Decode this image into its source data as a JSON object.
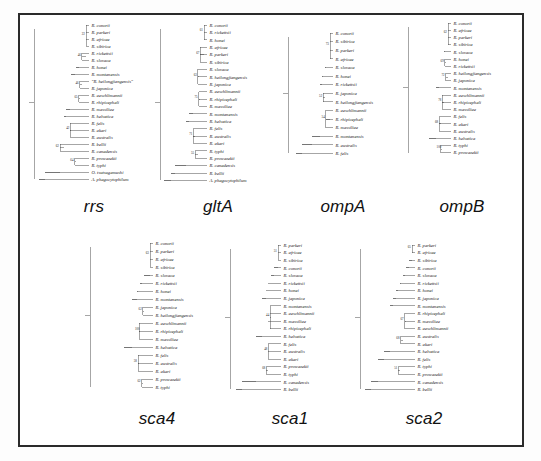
{
  "figure": {
    "caption_present": false,
    "panel_count": 7,
    "frame_color": "#2b2b2b",
    "branch_color": "#3a3a3a"
  },
  "panels": [
    {
      "id": "rrs",
      "gene_label": "rrs",
      "row": 1,
      "taxa": [
        "R. conorii",
        "R. parkeri",
        "R. africae",
        "R. sibirica",
        "R. rickettsii",
        "R. slovaca",
        "R. honei",
        "R. montanensis",
        "\"R. heilongjiangensis\"",
        "R. japonica",
        "R. aeschlimannii",
        "R. rhipicephali",
        "R. massiliae",
        "R. helvetica",
        "R. felis",
        "R. akari",
        "R. australis",
        "R. bellii",
        "R. canadensis",
        "R. prowazekii",
        "R. typhi",
        "O. tsutsugamushi",
        "A. phagocytophilum"
      ],
      "bootstraps": [
        "22",
        "46",
        "46",
        "65",
        "42",
        "62",
        "64",
        "79",
        "60",
        "61",
        "82",
        "44",
        "49",
        "52",
        "48",
        "40",
        "48",
        "65",
        "100",
        "100"
      ],
      "outgroups": [
        "O. tsutsugamushi",
        "A. phagocytophilum"
      ]
    },
    {
      "id": "gltA",
      "gene_label": "gltA",
      "row": 1,
      "taxa": [
        "R. conorii",
        "R. rickettsii",
        "R. honei",
        "R. africae",
        "R. parkeri",
        "R. sibirica",
        "R. slovaca",
        "R. heilongjiangensis",
        "R. japonica",
        "R. aeschlimannii",
        "R. rhipicephali",
        "R. massiliae",
        "R. montanensis",
        "R. helvetica",
        "R. felis",
        "R. australis",
        "R. akari",
        "R. typhi",
        "R. prowazekii",
        "R. canadensis",
        "R. bellii",
        "A. phagocytophilum"
      ],
      "bootstraps": [
        "61",
        "67",
        "63",
        "75",
        "71",
        "55",
        "100",
        "88",
        "93",
        "100",
        "66",
        "68",
        "46",
        "100",
        "100"
      ],
      "outgroups": [
        "A. phagocytophilum"
      ]
    },
    {
      "id": "ompA",
      "gene_label": "ompA",
      "row": 1,
      "taxa": [
        "R. conorii",
        "R. sibirica",
        "R. parkeri",
        "R. africae",
        "R. slovaca",
        "R. honei",
        "R. rickettsii",
        "R. japonica",
        "R. heilongjiangensis",
        "R. aeschlimannii",
        "R. rhipicephali",
        "R. massiliae",
        "R. montanensis",
        "R. australis",
        "R. felis"
      ],
      "bootstraps": [
        "73",
        "52",
        "54",
        "68",
        "62",
        "68",
        "61",
        "92",
        "100",
        "100",
        "55"
      ],
      "outgroups": []
    },
    {
      "id": "ompB",
      "gene_label": "ompB",
      "row": 1,
      "taxa": [
        "R. conorii",
        "R. africae",
        "R. parkeri",
        "R. sibirica",
        "R. slovaca",
        "R. honei",
        "R. rickettsii",
        "R. heilongjiangensis",
        "R. japonica",
        "R. montanensis",
        "R. aeschlimannii",
        "R. rhipicephali",
        "R. massiliae",
        "R. felis",
        "R. akari",
        "R. australis",
        "R. helvetica",
        "R. typhi",
        "R. prowazekii"
      ],
      "bootstraps": [
        "62",
        "69",
        "72",
        "78",
        "68",
        "100",
        "91",
        "100",
        "98",
        "88",
        "81",
        "64",
        "100"
      ],
      "outgroups": []
    },
    {
      "id": "sca4",
      "gene_label": "sca4",
      "row": 2,
      "taxa": [
        "R. conorii",
        "R. parkeri",
        "R. africae",
        "R. sibirica",
        "R. slovaca",
        "R. rickettsii",
        "R. honei",
        "R. montanensis",
        "R. japonica",
        "R. heilongjiangensis",
        "R. aeschlimannii",
        "R. rhipicephali",
        "R. massiliae",
        "R. helvetica",
        "R. felis",
        "R. australis",
        "R. akari",
        "R. prowazekii",
        "R. typhi"
      ],
      "bootstraps": [
        "63",
        "62",
        "100",
        "58",
        "62",
        "67",
        "68",
        "98",
        "100",
        "88",
        "100",
        "98",
        "100",
        "100",
        "100"
      ],
      "outgroups": []
    },
    {
      "id": "sca1",
      "gene_label": "sca1",
      "row": 2,
      "taxa": [
        "R. parkeri",
        "R. africae",
        "R. sibirica",
        "R. conorii",
        "R. slovaca",
        "R. rickettsii",
        "R. honei",
        "R. japonica",
        "R. montanensis",
        "R. aeschlimannii",
        "R. massiliae",
        "R. rhipicephali",
        "R. helvetica",
        "R. felis",
        "R. australis",
        "R. akari",
        "R. prowazekii",
        "R. typhi",
        "R. canadensis",
        "R. bellii"
      ],
      "bootstraps": [
        "51",
        "44",
        "48",
        "68",
        "48",
        "100",
        "100",
        "100",
        "87",
        "100",
        "90",
        "100",
        "100",
        "88"
      ],
      "outgroups": []
    },
    {
      "id": "sca2",
      "gene_label": "sca2",
      "row": 2,
      "taxa": [
        "R. parkeri",
        "R. africae",
        "R. sibirica",
        "R. conorii",
        "R. slovaca",
        "R. rickettsii",
        "R. honei",
        "R. japonica",
        "R. montanensis",
        "R. rhipicephali",
        "R. massiliae",
        "R. aeschlimannii",
        "R. australis",
        "R. akari",
        "R. helvetica",
        "R. felis",
        "R. typhi",
        "R. prowazekii",
        "R. canadensis",
        "R. bellii"
      ],
      "bootstraps": [
        "65",
        "67",
        "68",
        "51",
        "88",
        "67",
        "57",
        "100",
        "88",
        "100",
        "88",
        "100",
        "100"
      ],
      "outgroups": []
    }
  ]
}
